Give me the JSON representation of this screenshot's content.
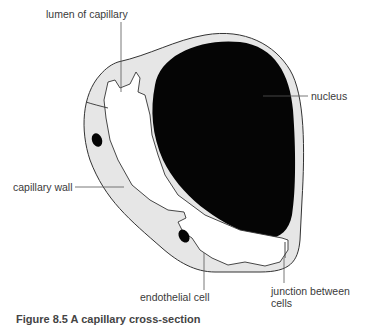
{
  "figure": {
    "colors": {
      "cytoplasm": "#e6e6e6",
      "nucleus": "#050505",
      "outline": "#333333",
      "leader_line": "#555555",
      "text": "#3a3a3a",
      "background": "#ffffff"
    },
    "labels": {
      "lumen": "lumen of capillary",
      "nucleus": "nucleus",
      "wall": "capillary wall",
      "endothelial": "endothelial cell",
      "junction_line1": "junction between",
      "junction_line2": "cells"
    },
    "caption": "Figure 8.5 A capillary cross-section"
  }
}
